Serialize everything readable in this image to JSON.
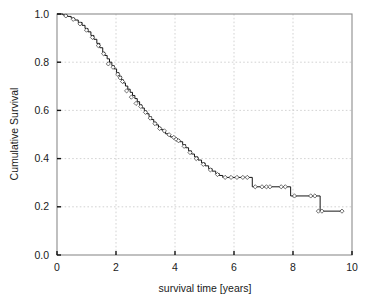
{
  "chart_data": {
    "type": "line",
    "subtype": "kaplan-meier-step",
    "title": "",
    "subtitle": "",
    "xlabel": "survival time [years]",
    "ylabel": "Cumulative Survival",
    "xlim": [
      0,
      10
    ],
    "ylim": [
      0.0,
      1.0
    ],
    "xticks": [
      0,
      2,
      4,
      6,
      8,
      10
    ],
    "xtick_labels": [
      "0",
      "2",
      "4",
      "6",
      "8",
      "10"
    ],
    "yticks": [
      0.0,
      0.2,
      0.4,
      0.6,
      0.8,
      1.0
    ],
    "ytick_labels": [
      "0.0",
      "0.2",
      "0.4",
      "0.6",
      "0.8",
      "1.0"
    ],
    "grid": true,
    "grid_style": "dotted",
    "grid_color": "#c8c8c8",
    "legend": false,
    "legend_position": "none",
    "frame": "full-rectangle",
    "frame_color": "#8c8c8c",
    "line_color": "#161616",
    "marker": "open-diamond",
    "marker_meaning": "censored observation",
    "series": [
      {
        "name": "Cumulative Survival",
        "x": [
          0.0,
          0.2,
          0.35,
          0.48,
          0.6,
          0.72,
          0.85,
          0.95,
          1.05,
          1.15,
          1.25,
          1.35,
          1.45,
          1.55,
          1.62,
          1.7,
          1.78,
          1.86,
          1.94,
          2.02,
          2.1,
          2.18,
          2.25,
          2.32,
          2.4,
          2.48,
          2.56,
          2.64,
          2.72,
          2.8,
          2.88,
          2.96,
          3.04,
          3.12,
          3.2,
          3.28,
          3.36,
          3.44,
          3.52,
          3.6,
          3.68,
          3.76,
          3.84,
          3.92,
          4.0,
          4.08,
          4.16,
          4.26,
          4.36,
          4.46,
          4.56,
          4.66,
          4.78,
          4.9,
          5.02,
          5.14,
          5.26,
          5.38,
          5.5,
          5.62,
          6.5,
          6.62,
          7.8,
          7.92,
          8.8,
          8.92,
          9.7
        ],
        "y": [
          1.0,
          0.996,
          0.99,
          0.983,
          0.975,
          0.965,
          0.953,
          0.94,
          0.926,
          0.911,
          0.895,
          0.878,
          0.86,
          0.841,
          0.828,
          0.814,
          0.8,
          0.786,
          0.772,
          0.757,
          0.742,
          0.727,
          0.714,
          0.701,
          0.688,
          0.675,
          0.662,
          0.649,
          0.636,
          0.623,
          0.61,
          0.598,
          0.586,
          0.574,
          0.562,
          0.551,
          0.54,
          0.53,
          0.52,
          0.511,
          0.503,
          0.496,
          0.49,
          0.486,
          0.483,
          0.478,
          0.47,
          0.458,
          0.445,
          0.432,
          0.419,
          0.407,
          0.394,
          0.382,
          0.37,
          0.358,
          0.348,
          0.338,
          0.33,
          0.322,
          0.322,
          0.283,
          0.283,
          0.245,
          0.245,
          0.182,
          0.182
        ],
        "censored_points": [
          {
            "x": 0.3,
            "y": 0.992
          },
          {
            "x": 0.55,
            "y": 0.978
          },
          {
            "x": 0.78,
            "y": 0.959
          },
          {
            "x": 1.0,
            "y": 0.933
          },
          {
            "x": 1.2,
            "y": 0.903
          },
          {
            "x": 1.4,
            "y": 0.869
          },
          {
            "x": 1.58,
            "y": 0.835
          },
          {
            "x": 1.74,
            "y": 0.793
          },
          {
            "x": 1.9,
            "y": 0.779
          },
          {
            "x": 2.06,
            "y": 0.75
          },
          {
            "x": 2.14,
            "y": 0.735
          },
          {
            "x": 2.22,
            "y": 0.72
          },
          {
            "x": 2.36,
            "y": 0.681
          },
          {
            "x": 2.52,
            "y": 0.655
          },
          {
            "x": 2.68,
            "y": 0.629
          },
          {
            "x": 2.84,
            "y": 0.616
          },
          {
            "x": 3.0,
            "y": 0.592
          },
          {
            "x": 3.16,
            "y": 0.568
          },
          {
            "x": 3.32,
            "y": 0.545
          },
          {
            "x": 3.48,
            "y": 0.525
          },
          {
            "x": 3.64,
            "y": 0.515
          },
          {
            "x": 3.8,
            "y": 0.499
          },
          {
            "x": 3.96,
            "y": 0.488
          },
          {
            "x": 4.04,
            "y": 0.48
          },
          {
            "x": 4.12,
            "y": 0.474
          },
          {
            "x": 4.31,
            "y": 0.451
          },
          {
            "x": 4.51,
            "y": 0.425
          },
          {
            "x": 4.72,
            "y": 0.4
          },
          {
            "x": 4.96,
            "y": 0.376
          },
          {
            "x": 5.2,
            "y": 0.353
          },
          {
            "x": 5.44,
            "y": 0.334
          },
          {
            "x": 5.7,
            "y": 0.322
          },
          {
            "x": 5.9,
            "y": 0.322
          },
          {
            "x": 6.1,
            "y": 0.322
          },
          {
            "x": 6.3,
            "y": 0.322
          },
          {
            "x": 6.45,
            "y": 0.322
          },
          {
            "x": 6.72,
            "y": 0.283
          },
          {
            "x": 6.95,
            "y": 0.283
          },
          {
            "x": 7.1,
            "y": 0.283
          },
          {
            "x": 7.22,
            "y": 0.283
          },
          {
            "x": 7.6,
            "y": 0.283
          },
          {
            "x": 7.74,
            "y": 0.283
          },
          {
            "x": 8.05,
            "y": 0.245
          },
          {
            "x": 8.6,
            "y": 0.245
          },
          {
            "x": 8.74,
            "y": 0.245
          },
          {
            "x": 8.86,
            "y": 0.182
          },
          {
            "x": 8.98,
            "y": 0.182
          },
          {
            "x": 9.66,
            "y": 0.182
          }
        ]
      }
    ]
  }
}
